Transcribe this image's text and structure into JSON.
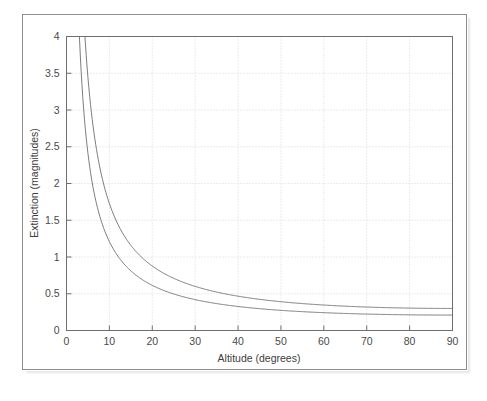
{
  "figure": {
    "background_color": "#ffffff",
    "frame_color": "#8e8e8e",
    "axis_color": "#6f6f6f",
    "grid_color": "#d8d8d8",
    "curve_color": "#6e6e6e",
    "text_color": "#4a4a4a"
  },
  "chart_data": {
    "type": "line",
    "title": "",
    "subtitle": "",
    "xlabel": "Altitude (degrees)",
    "ylabel": "Extinction (magnitudes)",
    "xlim": [
      0,
      90
    ],
    "ylim": [
      0,
      4
    ],
    "xticks": [
      0,
      10,
      20,
      30,
      40,
      50,
      60,
      70,
      80,
      90
    ],
    "xticklabels": [
      "0",
      "10",
      "20",
      "30",
      "40",
      "50",
      "60",
      "70",
      "80",
      "90"
    ],
    "yticks": [
      0,
      0.5,
      1,
      1.5,
      2,
      2.5,
      3,
      3.5,
      4
    ],
    "yticklabels": [
      "0",
      "0.5",
      "1",
      "1.5",
      "2",
      "2.5",
      "3",
      "3.5",
      "4"
    ],
    "grid": true,
    "grid_style": "dotted",
    "legend": "none",
    "annotations": [],
    "x": [
      1,
      1.5,
      2,
      2.5,
      3,
      3.5,
      4,
      5,
      6,
      7,
      8,
      9,
      10,
      12,
      14,
      16,
      18,
      20,
      25,
      30,
      35,
      40,
      45,
      50,
      55,
      60,
      65,
      70,
      75,
      80,
      85,
      90
    ],
    "series": [
      {
        "name": "upper-curve",
        "zenith_extinction": 0.3,
        "values": [
          17.19,
          11.46,
          8.6,
          6.88,
          5.73,
          4.92,
          4.3,
          3.44,
          2.87,
          2.46,
          2.16,
          1.92,
          1.73,
          1.44,
          1.24,
          1.09,
          0.97,
          0.88,
          0.71,
          0.6,
          0.52,
          0.47,
          0.42,
          0.39,
          0.37,
          0.35,
          0.33,
          0.32,
          0.31,
          0.3,
          0.3,
          0.3
        ]
      },
      {
        "name": "lower-curve",
        "zenith_extinction": 0.21,
        "values": [
          12.03,
          8.02,
          6.02,
          4.82,
          4.01,
          3.44,
          3.01,
          2.41,
          2.01,
          1.72,
          1.51,
          1.34,
          1.21,
          1.01,
          0.87,
          0.76,
          0.68,
          0.61,
          0.5,
          0.42,
          0.37,
          0.33,
          0.3,
          0.27,
          0.26,
          0.24,
          0.23,
          0.22,
          0.22,
          0.21,
          0.21,
          0.21
        ]
      }
    ]
  }
}
